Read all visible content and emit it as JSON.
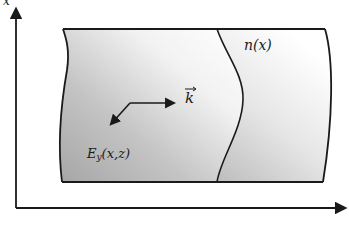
{
  "diagram": {
    "type": "waveguide-slab-schematic",
    "axes": {
      "vertical_label": "x",
      "horizontal_label": ""
    },
    "labels": {
      "refractive_index": "n(x)",
      "wave_vector": "k",
      "field_main": "E",
      "field_subscript": "y",
      "field_args": "(x,z)"
    },
    "colors": {
      "line": "#1a1a1a",
      "shade_dark": "#a9a9a9",
      "shade_light": "#ffffff",
      "background": "#ffffff"
    }
  }
}
